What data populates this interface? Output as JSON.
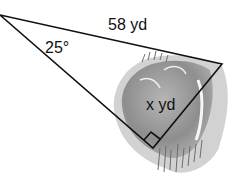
{
  "diagram": {
    "type": "right-triangle-word-problem",
    "labels": {
      "hypotenuse": "58 yd",
      "angle": "25°",
      "opposite_side": "x yd"
    },
    "vertices": {
      "A": [
        0,
        15
      ],
      "B": [
        222,
        64
      ],
      "C": [
        153,
        148
      ]
    },
    "right_angle_at": "C",
    "illustration": "pond",
    "colors": {
      "line": "#111111",
      "pond": "#9a9a9a",
      "pond_edge": "#c8c8c8",
      "grass": "#7a7a7a"
    }
  }
}
